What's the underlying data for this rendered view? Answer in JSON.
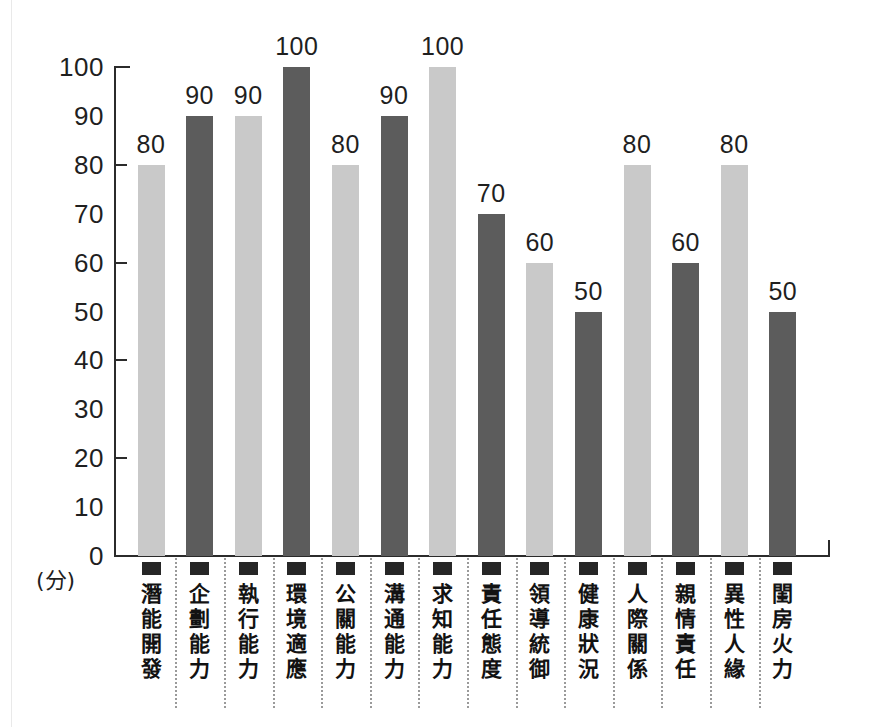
{
  "chart_data": {
    "type": "bar",
    "title": "",
    "subtitle": "",
    "xlabel": "",
    "ylabel": "(分)",
    "ylim": [
      0,
      100
    ],
    "grid": false,
    "legend": "none",
    "y_ticks": [
      100,
      90,
      80,
      70,
      60,
      50,
      40,
      30,
      20,
      10,
      0
    ],
    "y_tick_marks": [
      100,
      80,
      60,
      40,
      20
    ],
    "categories": [
      "潛能開發",
      "企劃能力",
      "執行能力",
      "環境適應",
      "公關能力",
      "溝通能力",
      "求知能力",
      "責任態度",
      "領導統御",
      "健康狀況",
      "人際關係",
      "親情責任",
      "異性人緣",
      "閨房火力"
    ],
    "values": [
      80,
      90,
      90,
      100,
      80,
      90,
      100,
      70,
      60,
      50,
      80,
      60,
      80,
      50
    ],
    "value_labels": [
      "80",
      "90",
      "90",
      "100",
      "80",
      "90",
      "100",
      "70",
      "60",
      "50",
      "80",
      "60",
      "80",
      "50"
    ],
    "bar_colors": [
      "#c9c9c9",
      "#5c5c5c",
      "#c9c9c9",
      "#5c5c5c",
      "#c9c9c9",
      "#5c5c5c",
      "#c9c9c9",
      "#5c5c5c",
      "#c9c9c9",
      "#5c5c5c",
      "#c9c9c9",
      "#5c5c5c",
      "#c9c9c9",
      "#5c5c5c"
    ],
    "palette": {
      "light_bar": "#c9c9c9",
      "dark_bar": "#5c5c5c",
      "axis": "#2b2b2b",
      "text": "#1f1f1f",
      "separator": "#9a9a9a",
      "background": "#ffffff"
    },
    "category_marker": "filled-square"
  }
}
